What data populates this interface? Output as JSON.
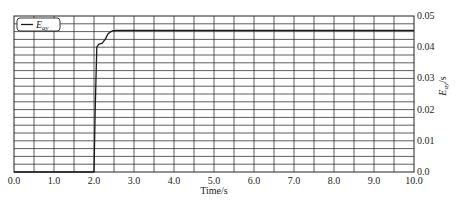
{
  "chart_data": {
    "type": "line",
    "title": "",
    "xlabel": "Time/s",
    "ylabel": "E_ay/s",
    "ylabel_main": "E",
    "ylabel_sub": "ay",
    "ylabel_suffix": "/s",
    "xlim": [
      0.0,
      10.0
    ],
    "ylim": [
      0.0,
      0.05
    ],
    "x_ticks": [
      0.0,
      1.0,
      2.0,
      3.0,
      4.0,
      5.0,
      6.0,
      7.0,
      8.0,
      9.0,
      10.0
    ],
    "x_tick_labels": [
      "0.0",
      "1.0",
      "2.0",
      "3.0",
      "4.0",
      "5.0",
      "6.0",
      "7.0",
      "8.0",
      "9.0",
      "10.0"
    ],
    "y_ticks": [
      0.0,
      0.01,
      0.02,
      0.03,
      0.04,
      0.05
    ],
    "y_tick_labels": [
      "0.0",
      "0.01",
      "0.02",
      "0.03",
      "0.04",
      "0.05"
    ],
    "y_axis_position": "right",
    "grid": true,
    "grid_x_step": 0.5,
    "grid_y_step": 0.0025,
    "legend": {
      "position": "upper left",
      "entries": [
        {
          "label_main": "E",
          "label_sub": "ay",
          "label": "E_ay"
        }
      ]
    },
    "series": [
      {
        "name": "E_ay",
        "color": "#1a1a1a",
        "x": [
          0.0,
          1.9,
          2.0,
          2.03,
          2.07,
          2.12,
          2.2,
          2.28,
          2.35,
          2.45,
          2.55,
          3.0,
          4.0,
          5.0,
          6.0,
          7.0,
          8.0,
          9.0,
          10.0
        ],
        "y": [
          0.0,
          0.0,
          0.0,
          0.02,
          0.04,
          0.041,
          0.0412,
          0.0425,
          0.0443,
          0.0452,
          0.0454,
          0.0454,
          0.0454,
          0.0454,
          0.0454,
          0.0454,
          0.0454,
          0.0454,
          0.0454
        ]
      }
    ]
  }
}
